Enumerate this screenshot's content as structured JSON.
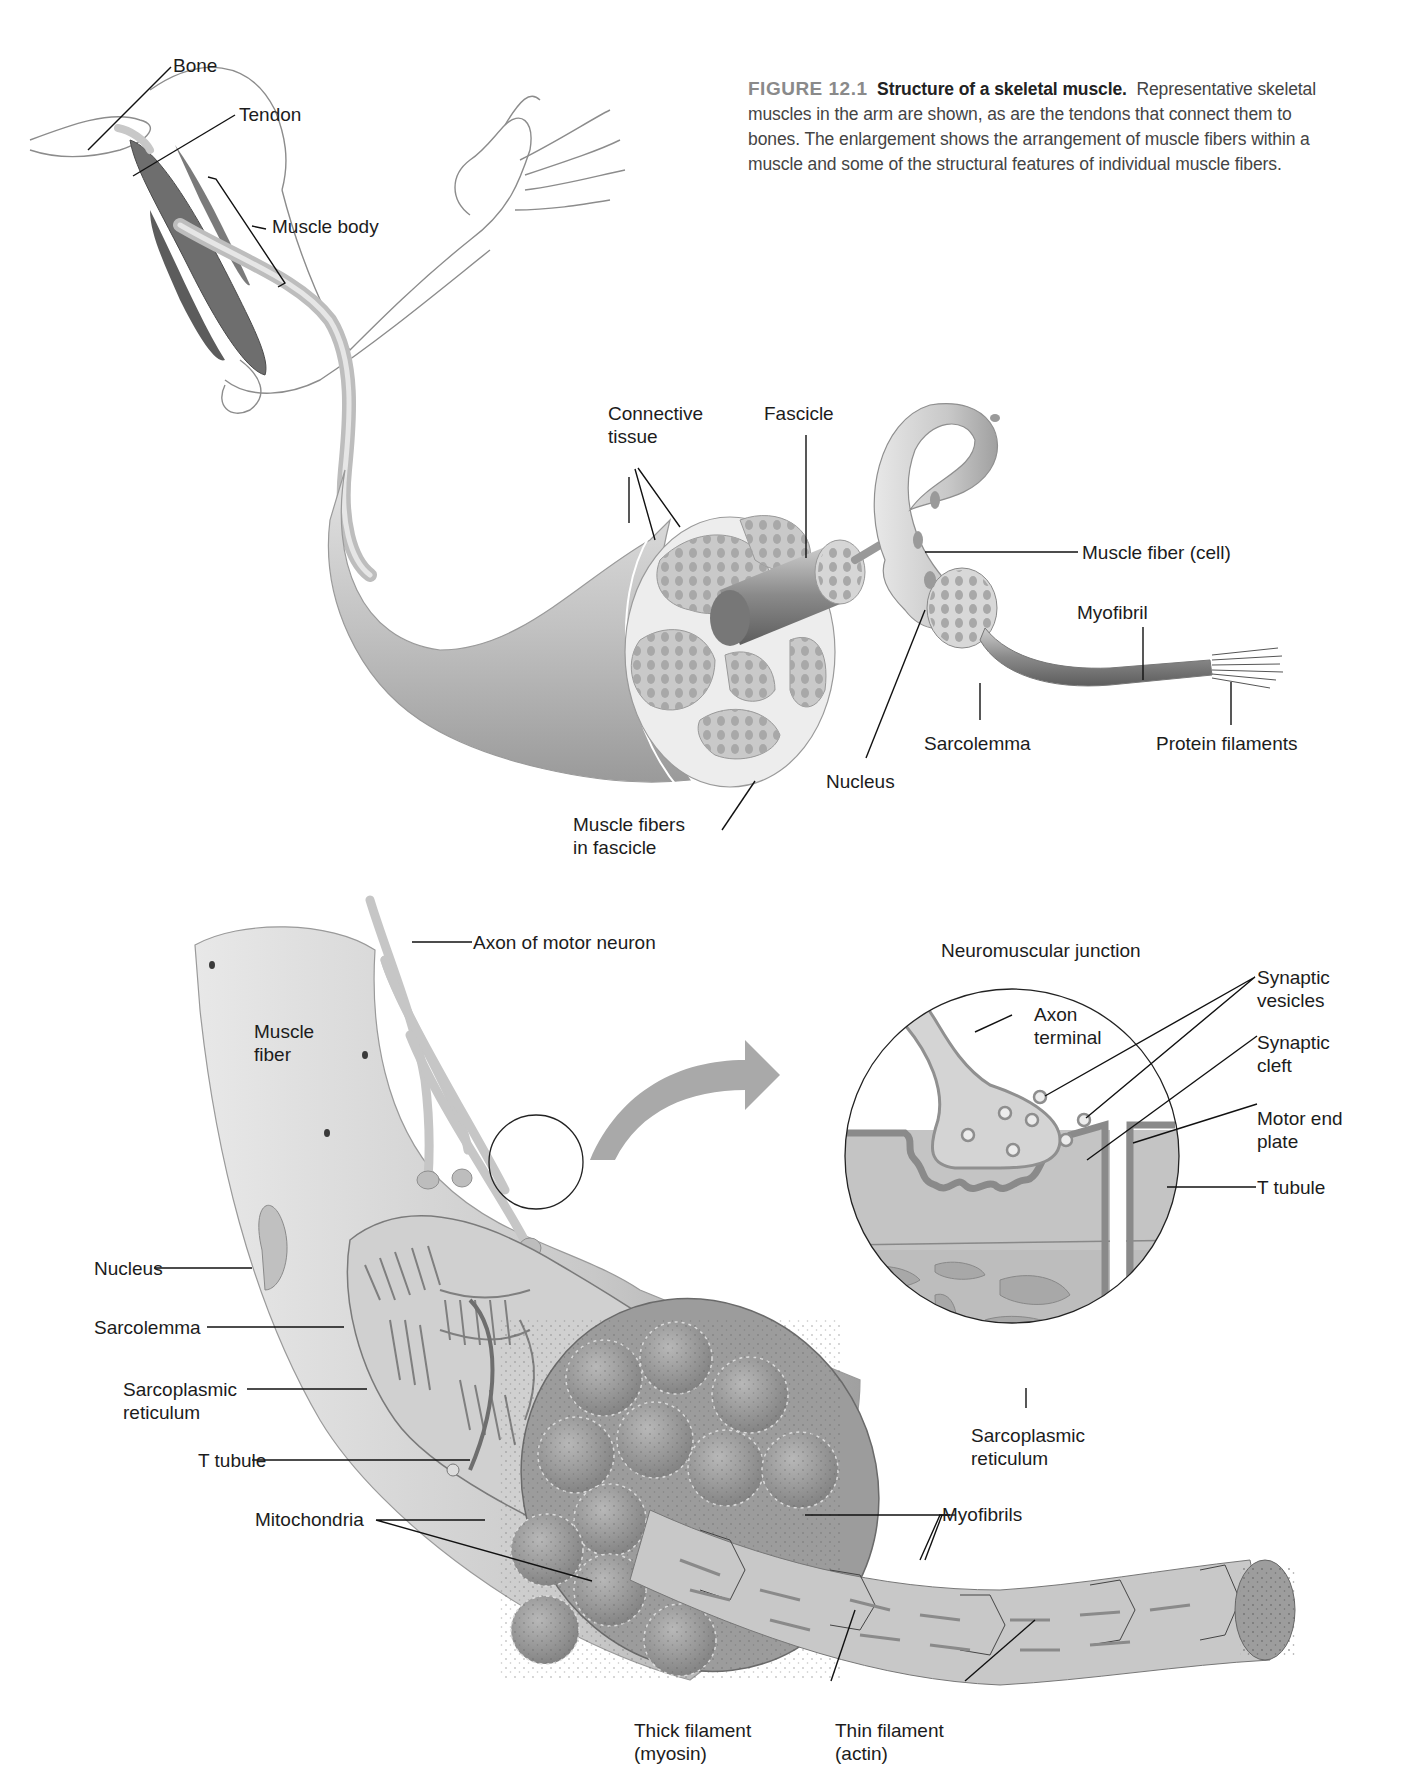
{
  "figure": {
    "number": "FIGURE 12.1",
    "title": "Structure of a skeletal muscle.",
    "caption_line1": "Representative skeletal",
    "caption_line2": "muscles in the arm are shown, as are the tendons that connect them to",
    "caption_line3": "bones. The enlargement shows the arrangement of muscle fibers within a",
    "caption_line4": "muscle and some of the structural features of individual muscle fibers."
  },
  "top_panel": {
    "labels": {
      "bone": "Bone",
      "tendon": "Tendon",
      "muscle_body": "Muscle body",
      "connective_tissue": "Connective\ntissue",
      "fascicle": "Fascicle",
      "muscle_fiber_cell": "Muscle fiber (cell)",
      "myofibril": "Myofibril",
      "sarcolemma": "Sarcolemma",
      "protein_filaments": "Protein filaments",
      "nucleus": "Nucleus",
      "muscle_fibers_in_fascicle": "Muscle fibers\nin fascicle"
    }
  },
  "bottom_panel": {
    "labels": {
      "axon_of_motor_neuron": "Axon of motor neuron",
      "muscle_fiber": "Muscle\nfiber",
      "nucleus": "Nucleus",
      "sarcolemma": "Sarcolemma",
      "sarcoplasmic_reticulum": "Sarcoplasmic\nreticulum",
      "t_tubule": "T tubule",
      "mitochondria": "Mitochondria",
      "myofibrils": "Myofibrils",
      "thick_filament": "Thick filament\n(myosin)",
      "thin_filament": "Thin filament\n(actin)"
    },
    "inset": {
      "title": "Neuromuscular junction",
      "labels": {
        "axon_terminal": "Axon\nterminal",
        "synaptic_vesicles": "Synaptic\nvesicles",
        "synaptic_cleft": "Synaptic\ncleft",
        "motor_end_plate": "Motor end\nplate",
        "t_tubule": "T tubule",
        "sarcoplasmic_reticulum": "Sarcoplasmic\nreticulum"
      }
    }
  },
  "colors": {
    "background": "#ffffff",
    "label_text": "#1c1c1c",
    "figure_number": "#8a8a8a",
    "tissue_light": "#d9d9d9",
    "tissue_mid": "#b5b5b5",
    "tissue_dark": "#8e8e8e",
    "leader_line": "#111111"
  }
}
